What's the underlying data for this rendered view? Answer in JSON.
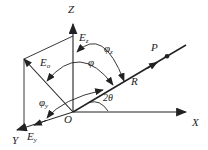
{
  "figure": {
    "labels": {
      "z_axis": "Z",
      "x_axis": "X",
      "y_axis": "Y",
      "origin": "O",
      "point_p": "P",
      "ray_r": "R",
      "e_z": {
        "base": "E",
        "sub": "z"
      },
      "e_o": {
        "base": "E",
        "sub": "o"
      },
      "e_y": {
        "base": "E",
        "sub": "y"
      },
      "angle_phi": "φ",
      "angle_phi_z": {
        "base": "φ",
        "sub": "z"
      },
      "angle_phi_y": {
        "base": "φ",
        "sub": "y"
      },
      "angle_2theta": "2θ"
    },
    "colors": {
      "line": "#222222",
      "background": "#ffffff"
    }
  }
}
